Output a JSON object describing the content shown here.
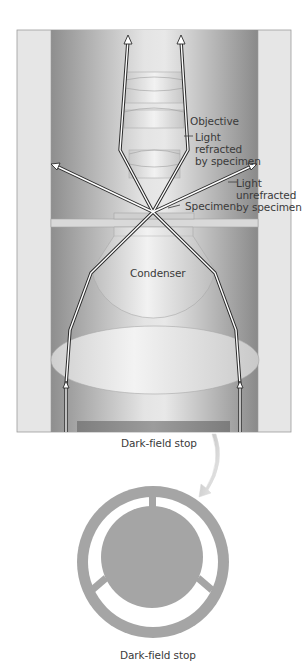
{
  "figure": {
    "labels": {
      "objective": "Objective",
      "light_refracted": "Light\nrefracted\nby specimen",
      "light_unrefracted": "Light\nunrefracted\nby specimen",
      "specimen": "Specimen",
      "condenser": "Condenser",
      "dark_field_stop_top": "Dark-field stop",
      "dark_field_stop_bottom": "Dark-field stop"
    },
    "colors": {
      "outer_column": "#e6e6e6",
      "inner_column_dark": "#9a9a9a",
      "inner_column_light": "#e2e2e2",
      "lens_fill": "#dcdcdc",
      "ray_outline": "#2b2b2b",
      "ray_fill": "#ffffff",
      "stop_bar": "#8f8f8f",
      "stop_disk": "#a5a5a5",
      "arrow_curve": "#cfcfcf",
      "label_text": "#3a3a3a"
    }
  }
}
